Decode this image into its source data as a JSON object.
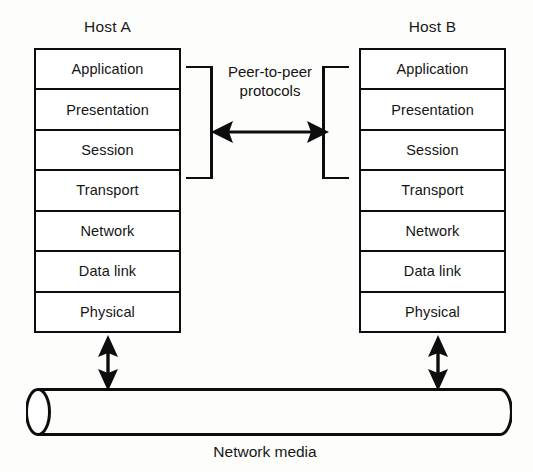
{
  "figure": {
    "ink_color": "#0d0d0d",
    "background_color": "#fdfdfc"
  },
  "hosts": [
    {
      "id": "host-a",
      "title": "Host A",
      "layers": [
        "Application",
        "Presentation",
        "Session",
        "Transport",
        "Network",
        "Data link",
        "Physical"
      ]
    },
    {
      "id": "host-b",
      "title": "Host B",
      "layers": [
        "Application",
        "Presentation",
        "Session",
        "Transport",
        "Network",
        "Data link",
        "Physical"
      ]
    }
  ],
  "peer": {
    "caption_line1": "Peer-to-peer",
    "caption_line2": "protocols",
    "bracket_top_layer": "Application",
    "bracket_bottom_layer": "Transport",
    "arrow_icon": "double-headed-horizontal-arrow-icon"
  },
  "media": {
    "label": "Network media",
    "shape": "cylinder",
    "connector_icon": "double-headed-vertical-arrow-icon"
  }
}
